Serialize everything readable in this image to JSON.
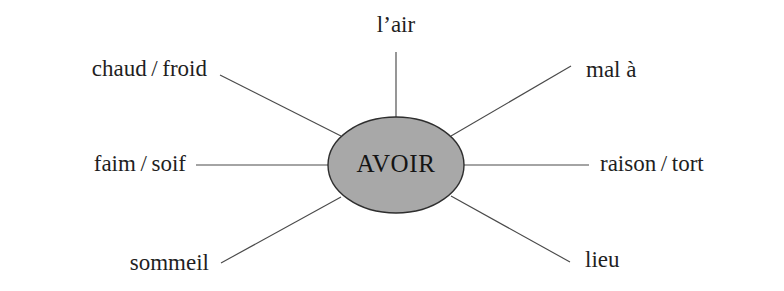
{
  "diagram": {
    "type": "radial-word-web",
    "center": {
      "label": "AVOIR",
      "fill_color": "#a8a8a8",
      "stroke_color": "#2e2e2e",
      "cx": 396,
      "cy": 165,
      "rx": 68,
      "ry": 48
    },
    "background_color": "#ffffff",
    "line_color": "#4a4a4a",
    "text_color": "#1f1f1f",
    "nodes": [
      {
        "id": "l-air",
        "label": "l’air",
        "position": "top",
        "text_x": 396,
        "text_y": 27,
        "anchor": "middle",
        "line": {
          "x1": 396,
          "y1": 52,
          "x2": 396,
          "y2": 118
        }
      },
      {
        "id": "mal-a",
        "label": "mal à",
        "position": "top-right",
        "text_x": 586,
        "text_y": 72,
        "anchor": "start",
        "line": {
          "x1": 571,
          "y1": 66,
          "x2": 451,
          "y2": 136
        }
      },
      {
        "id": "raison-tort",
        "label": "raison / tort",
        "position": "right",
        "text_x": 600,
        "text_y": 166,
        "anchor": "start",
        "line": {
          "x1": 589,
          "y1": 165,
          "x2": 464,
          "y2": 165
        }
      },
      {
        "id": "lieu",
        "label": "lieu",
        "position": "bottom-right",
        "text_x": 585,
        "text_y": 262,
        "anchor": "start",
        "line": {
          "x1": 570,
          "y1": 262,
          "x2": 451,
          "y2": 196
        }
      },
      {
        "id": "sommeil",
        "label": "sommeil",
        "position": "bottom-left",
        "text_x": 209,
        "text_y": 265,
        "anchor": "end",
        "line": {
          "x1": 221,
          "y1": 263,
          "x2": 341,
          "y2": 197
        }
      },
      {
        "id": "faim-soif",
        "label": "faim / soif",
        "position": "left",
        "text_x": 186,
        "text_y": 166,
        "anchor": "end",
        "line": {
          "x1": 196,
          "y1": 165,
          "x2": 329,
          "y2": 165
        }
      },
      {
        "id": "chaud-froid",
        "label": "chaud / froid",
        "position": "top-left",
        "text_x": 207,
        "text_y": 71,
        "anchor": "end",
        "line": {
          "x1": 220,
          "y1": 75,
          "x2": 341,
          "y2": 136
        }
      }
    ]
  }
}
